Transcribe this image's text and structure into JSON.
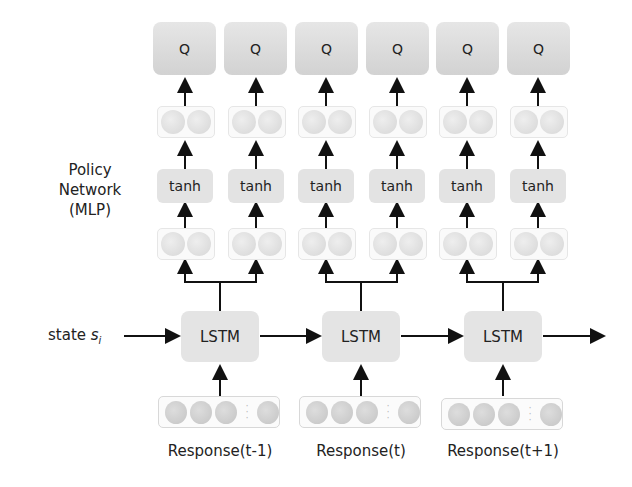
{
  "side_label": {
    "line1": "Policy",
    "line2": "Network",
    "line3": "(MLP)"
  },
  "state_label": {
    "text": "state ",
    "symbol": "s",
    "subscript": "i"
  },
  "q_nodes": [
    "Q",
    "Q",
    "Q",
    "Q",
    "Q",
    "Q"
  ],
  "tanh_nodes": [
    "tanh",
    "tanh",
    "tanh",
    "tanh",
    "tanh",
    "tanh"
  ],
  "lstm_nodes": [
    "LSTM",
    "LSTM",
    "LSTM"
  ],
  "responses": [
    "Response(t-1)",
    "Response(t)",
    "Response(t+1)"
  ],
  "colors": {
    "node_fill": "#e4e4e4",
    "q_fill": "#d8d8d8",
    "arrow": "#111111",
    "neuron": "#cccccc"
  }
}
